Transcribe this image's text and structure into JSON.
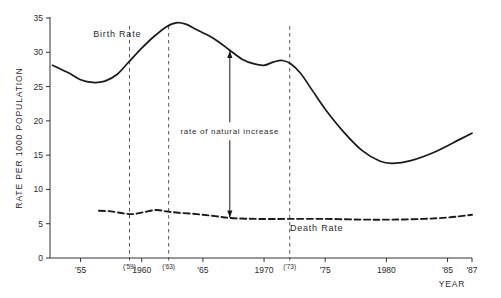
{
  "chart_data": {
    "type": "line",
    "title": "",
    "xlabel": "YEAR",
    "ylabel": "RATE PER 1000 POPULATION",
    "xlim": [
      1952.5,
      1987
    ],
    "ylim": [
      0,
      35
    ],
    "grid": false,
    "legend": "inline-labels",
    "y_ticks": [
      0,
      5,
      10,
      15,
      20,
      25,
      30,
      35
    ],
    "y_tick_labels": [
      "0",
      "5",
      "10",
      "15",
      "20",
      "25",
      "30",
      "35"
    ],
    "x_ticks": [
      1955,
      1960,
      1965,
      1970,
      1975,
      1980,
      1985,
      1987
    ],
    "x_tick_labels": [
      "'55",
      "1960",
      "'65",
      "1970",
      "'75",
      "1980",
      "'85",
      "'87"
    ],
    "reference_lines": [
      {
        "x": 1959,
        "label": "('59)",
        "style": "dashed"
      },
      {
        "x": 1962.2,
        "label": "('63)",
        "style": "dashed"
      },
      {
        "x": 1972.1,
        "label": "('73)",
        "style": "dashed"
      }
    ],
    "annotations": [
      {
        "text": "rate of natural increase",
        "x": 1967.2,
        "type": "double-arrow",
        "from_series": "Birth Rate",
        "to_series": "Death Rate",
        "y_top": 30.2,
        "y_bottom": 5.9
      }
    ],
    "series": [
      {
        "name": "Birth Rate",
        "style": "solid",
        "color": "#1a1a1a",
        "label_x": 1958.0,
        "label_y": 32.2,
        "x": [
          1952.7,
          1954,
          1955,
          1956,
          1957,
          1958,
          1959,
          1960,
          1961,
          1962,
          1962.8,
          1963.6,
          1964.5,
          1965.5,
          1966.3,
          1967.2,
          1968.2,
          1969.2,
          1970.0,
          1970.8,
          1971.5,
          1972.2,
          1973.0,
          1974.0,
          1975.0,
          1976.5,
          1978.0,
          1979.5,
          1980.5,
          1982.0,
          1984.0,
          1986.0,
          1987.0
        ],
        "y": [
          28.1,
          27.0,
          26.0,
          25.6,
          25.8,
          26.8,
          28.7,
          30.6,
          32.3,
          33.7,
          34.3,
          34.1,
          33.3,
          32.4,
          31.5,
          30.3,
          29.0,
          28.3,
          28.1,
          28.6,
          28.8,
          28.3,
          26.9,
          24.3,
          21.7,
          18.4,
          15.7,
          14.1,
          13.8,
          14.2,
          15.5,
          17.3,
          18.2
        ]
      },
      {
        "name": "Death Rate",
        "style": "dashed",
        "color": "#1a1a1a",
        "label_x": 1974.3,
        "label_y": 3.9,
        "x": [
          1956.5,
          1957.5,
          1958.5,
          1959.3,
          1960.2,
          1961.2,
          1962.0,
          1963.0,
          1964.5,
          1966.0,
          1967.5,
          1969.5,
          1972.0,
          1975.0,
          1978.0,
          1980.5,
          1983.0,
          1985.0,
          1986.5,
          1987.0
        ],
        "y": [
          6.9,
          6.8,
          6.5,
          6.4,
          6.7,
          7.0,
          6.8,
          6.6,
          6.4,
          6.1,
          5.8,
          5.7,
          5.7,
          5.7,
          5.6,
          5.6,
          5.7,
          5.9,
          6.2,
          6.3
        ]
      }
    ]
  }
}
